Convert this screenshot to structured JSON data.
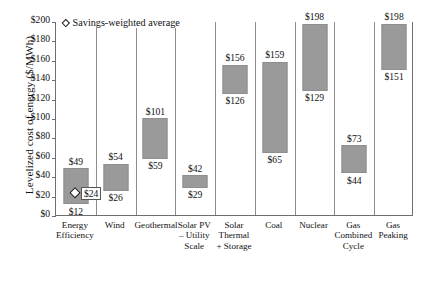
{
  "chart_data": {
    "type": "bar",
    "subtype": "floating-range-bar",
    "title": "",
    "xlabel": "",
    "ylabel": "Levelized cost of energy ($/MWh)",
    "ylim": [
      0,
      200
    ],
    "ytick_labels": [
      "$200",
      "$180",
      "$160",
      "$140",
      "$120",
      "$100",
      "$80",
      "$60",
      "$40",
      "$20",
      "$0"
    ],
    "ytick_values": [
      200,
      180,
      160,
      140,
      120,
      100,
      80,
      60,
      40,
      20,
      0
    ],
    "grid": false,
    "legend_position": "top-left",
    "categories": [
      "Energy Efficiency",
      "Wind",
      "Geothermal",
      "Solar PV – Utility Scale",
      "Solar Thermal + Storage",
      "Coal",
      "Nuclear",
      "Gas Combined Cycle",
      "Gas Peaking"
    ],
    "category_lines": [
      [
        "Energy",
        "Efficiency"
      ],
      [
        "Wind"
      ],
      [
        "Geothermal"
      ],
      [
        "Solar PV",
        "– Utility",
        "Scale"
      ],
      [
        "Solar",
        "Thermal",
        "+ Storage"
      ],
      [
        "Coal"
      ],
      [
        "Nuclear"
      ],
      [
        "Gas",
        "Combined",
        "Cycle"
      ],
      [
        "Gas",
        "Peaking"
      ]
    ],
    "low": [
      12,
      26,
      59,
      29,
      126,
      65,
      129,
      44,
      151
    ],
    "high": [
      49,
      54,
      101,
      42,
      156,
      159,
      198,
      73,
      198
    ],
    "low_labels": [
      "$12",
      "$26",
      "$59",
      "$29",
      "$126",
      "$65",
      "$129",
      "$44",
      "$151"
    ],
    "high_labels": [
      "$49",
      "$54",
      "$101",
      "$42",
      "$156",
      "$159",
      "$198",
      "$73",
      "$198"
    ],
    "bar_color": "#9a9a9a",
    "legend": [
      {
        "label": "Savings-weighted average",
        "marker": "hollow-diamond"
      }
    ],
    "annotations": [
      {
        "name": "savings-weighted-average-marker",
        "category": "Energy Efficiency",
        "value": 24,
        "label": "$24",
        "marker": "hollow-diamond"
      }
    ]
  }
}
